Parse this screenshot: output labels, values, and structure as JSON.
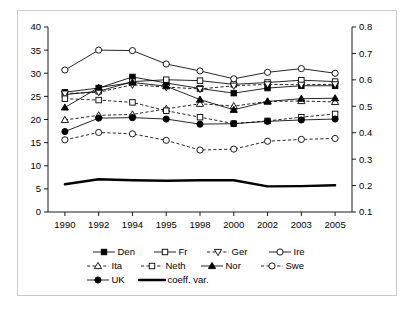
{
  "chart_data": {
    "type": "line",
    "title": "",
    "xlabel": "",
    "ylabel": "",
    "categories": [
      "1990",
      "1992",
      "1994",
      "1995",
      "1998",
      "2000",
      "2002",
      "2003",
      "2005"
    ],
    "axes": {
      "left": {
        "ticks": [
          "0",
          "5",
          "10",
          "15",
          "20",
          "25",
          "30",
          "35",
          "40"
        ],
        "tick_values": [
          0,
          5,
          10,
          15,
          20,
          25,
          30,
          35,
          40
        ],
        "ylim": [
          0,
          40
        ],
        "applies_to": [
          "Den",
          "Fr",
          "Ger",
          "Ire",
          "Ita",
          "Neth",
          "Nor",
          "Swe",
          "UK"
        ]
      },
      "right": {
        "ticks": [
          "0.1",
          "0.2",
          "0.3",
          "0.4",
          "0.5",
          "0.6",
          "0.7",
          "0.8"
        ],
        "tick_values": [
          0.1,
          0.2,
          0.3,
          0.4,
          0.5,
          0.6,
          0.7,
          0.8
        ],
        "ylim": [
          0.1,
          0.8
        ],
        "applies_to": [
          "coeff. var."
        ]
      }
    },
    "grid": false,
    "legend_position": "bottom",
    "series": [
      {
        "name": "Den",
        "label": "Den",
        "marker": "square",
        "fill": "filled",
        "line": "solid",
        "axis": "left",
        "values": [
          25.9,
          26.8,
          29.2,
          27.9,
          26.7,
          25.7,
          26.8,
          27.3,
          27.3
        ]
      },
      {
        "name": "Fr",
        "label": "Fr",
        "marker": "square",
        "fill": "open",
        "line": "solid",
        "axis": "left",
        "values": [
          25.4,
          26.1,
          28.2,
          28.6,
          28.4,
          27.6,
          28.0,
          28.5,
          28.2
        ]
      },
      {
        "name": "Ger",
        "label": "Ger",
        "marker": "triangle-down",
        "fill": "open",
        "line": "dashed",
        "axis": "left",
        "values": [
          25.6,
          25.9,
          27.5,
          27.0,
          26.6,
          27.3,
          27.6,
          27.5,
          27.6
        ]
      },
      {
        "name": "Ire",
        "label": "Ire",
        "marker": "circle",
        "fill": "open",
        "line": "solid",
        "axis": "left",
        "values": [
          30.7,
          35.0,
          34.9,
          32.0,
          30.5,
          28.8,
          30.2,
          31.0,
          30.0
        ]
      },
      {
        "name": "Ita",
        "label": "Ita",
        "marker": "triangle-up",
        "fill": "open",
        "line": "dashed",
        "axis": "left",
        "values": [
          19.9,
          20.9,
          21.1,
          22.3,
          23.4,
          22.9,
          23.9,
          24.0,
          23.8
        ]
      },
      {
        "name": "Neth",
        "label": "Neth",
        "marker": "square",
        "fill": "open",
        "line": "dashed",
        "axis": "left",
        "values": [
          24.5,
          24.2,
          23.7,
          21.9,
          20.5,
          19.1,
          19.7,
          20.5,
          21.2
        ]
      },
      {
        "name": "Nor",
        "label": "Nor",
        "marker": "triangle-up",
        "fill": "filled",
        "line": "solid",
        "axis": "left",
        "values": [
          22.6,
          26.9,
          28.0,
          27.2,
          24.3,
          22.1,
          23.9,
          24.5,
          24.6
        ]
      },
      {
        "name": "Swe",
        "label": "Swe",
        "marker": "circle",
        "fill": "open",
        "line": "dashed",
        "axis": "left",
        "values": [
          15.6,
          17.2,
          16.9,
          15.5,
          13.4,
          13.6,
          15.3,
          15.7,
          15.9
        ]
      },
      {
        "name": "UK",
        "label": "UK",
        "marker": "circle",
        "fill": "filled",
        "line": "solid",
        "axis": "left",
        "values": [
          17.4,
          20.3,
          20.4,
          20.1,
          19.0,
          19.1,
          19.6,
          19.9,
          20.1
        ]
      },
      {
        "name": "coeff. var.",
        "label": "coeff. var.",
        "marker": "none",
        "fill": "none",
        "line": "thick",
        "axis": "right",
        "values": [
          0.205,
          0.224,
          0.22,
          0.218,
          0.22,
          0.22,
          0.197,
          0.198,
          0.201
        ]
      }
    ]
  },
  "legend": {
    "rows": [
      [
        "Den",
        "Fr",
        "Ger",
        "Ire"
      ],
      [
        "Ita",
        "Neth",
        "Nor",
        "Swe"
      ],
      [
        "UK",
        "coeff. var."
      ]
    ]
  },
  "colors": {
    "ink": "#000000",
    "frame": "#c9c9c9",
    "background": "#ffffff"
  }
}
